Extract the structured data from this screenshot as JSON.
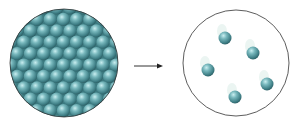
{
  "diagram": {
    "left_panel": {
      "label": "",
      "particle_color": "#5fa0a6",
      "arrangement": "hexagonal close-packed",
      "rows": 9
    },
    "arrow": {
      "direction": "right",
      "color": "#333333"
    },
    "right_panel": {
      "label": "",
      "particle_color": "#5a9ea4",
      "particle_count": 5,
      "particles": [
        {
          "x": 225,
          "y": 38
        },
        {
          "x": 253,
          "y": 53
        },
        {
          "x": 208,
          "y": 70
        },
        {
          "x": 267,
          "y": 84
        },
        {
          "x": 235,
          "y": 97
        }
      ]
    }
  }
}
